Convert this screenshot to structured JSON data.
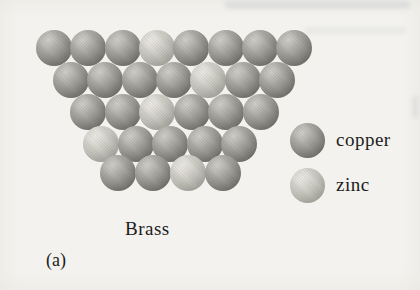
{
  "figure": {
    "caption": "Brass",
    "part_label": "(a)",
    "background_color": "#f3f2ee",
    "text_color": "#1c1c1c"
  },
  "legend": {
    "items": [
      {
        "type": "copper",
        "label": "copper"
      },
      {
        "type": "zinc",
        "label": "zinc"
      }
    ]
  },
  "atom_colors": {
    "copper": {
      "highlight": "#d3d2cd",
      "mid": "#9d9c96",
      "shadow": "#5f5e59"
    },
    "zinc": {
      "highlight": "#efede7",
      "mid": "#c9c8c0",
      "shadow": "#96958d"
    }
  },
  "atoms": {
    "sphere_diameter": 36,
    "rows": [
      {
        "y": 30,
        "x_start": 36,
        "spacing": 34.3,
        "types": [
          "copper",
          "copper",
          "copper",
          "zinc",
          "copper",
          "copper",
          "copper",
          "copper"
        ]
      },
      {
        "y": 62,
        "x_start": 53,
        "spacing": 34.3,
        "types": [
          "copper",
          "copper",
          "copper",
          "copper",
          "zinc",
          "copper",
          "copper"
        ]
      },
      {
        "y": 94,
        "x_start": 70,
        "spacing": 34.6,
        "types": [
          "copper",
          "copper",
          "zinc",
          "copper",
          "copper",
          "copper"
        ]
      },
      {
        "y": 126,
        "x_start": 83,
        "spacing": 34.5,
        "types": [
          "zinc",
          "copper",
          "copper",
          "copper",
          "copper"
        ]
      },
      {
        "y": 155,
        "x_start": 100,
        "spacing": 35,
        "types": [
          "copper",
          "copper",
          "zinc",
          "copper"
        ]
      }
    ]
  }
}
